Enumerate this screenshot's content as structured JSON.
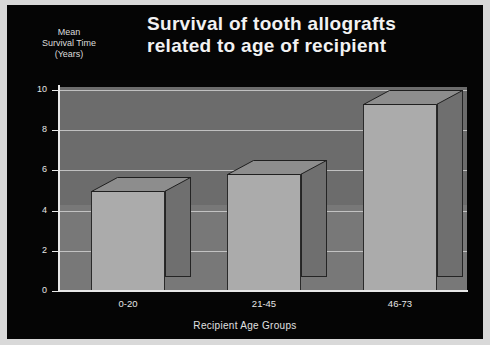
{
  "slide": {
    "background_color": "#050505",
    "frame_color": "#d9d9d9",
    "text_color": "#f0f0f0"
  },
  "title": {
    "line1": "Survival of tooth allografts",
    "line2": "related to age of recipient"
  },
  "y_axis_caption": {
    "line1": "Mean",
    "line2": "Survival Time",
    "line3": "(Years)"
  },
  "x_axis_caption": "Recipient Age Groups",
  "chart_data": {
    "type": "bar",
    "title": "Survival of tooth allografts related to age of recipient",
    "xlabel": "Recipient Age Groups",
    "ylabel": "Mean Survival Time (Years)",
    "categories": [
      "0-20",
      "21-45",
      "46-73"
    ],
    "values": [
      5.0,
      5.8,
      9.3
    ],
    "ylim": [
      0,
      10
    ],
    "yticks": [
      "0",
      "2",
      "4",
      "6",
      "8",
      "10"
    ],
    "ytick_values": [
      0,
      2,
      4,
      6,
      8,
      10
    ],
    "grid": true,
    "legend": "none",
    "style": "3d-bar",
    "bar_face_color": "#ababab",
    "bar_side_color": "#6f6f6f",
    "bar_top_color": "#8d8d8d",
    "plot_background_color": "#6c6c6c",
    "gridline_color": "#cfcfcf"
  }
}
